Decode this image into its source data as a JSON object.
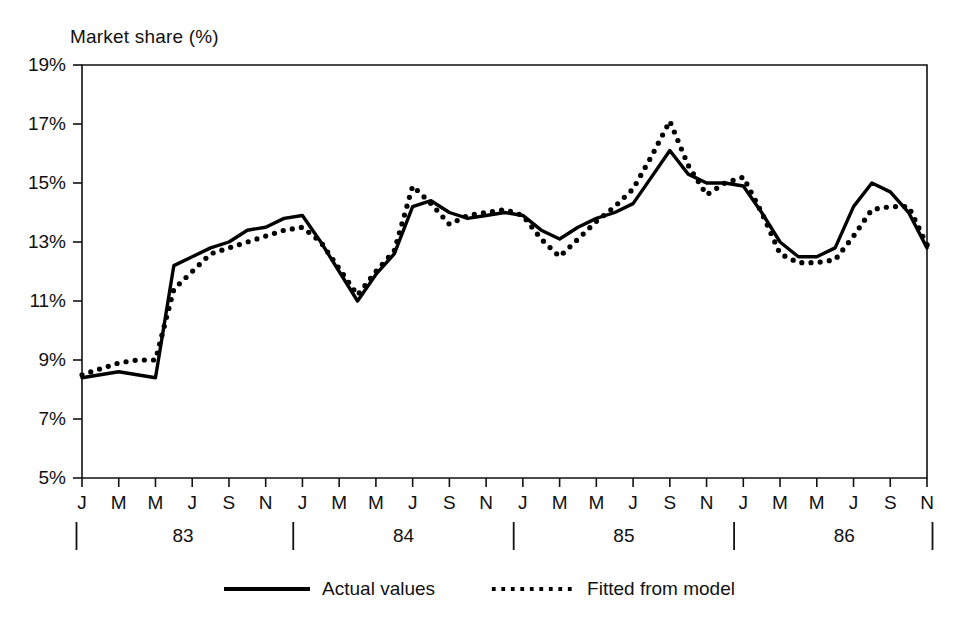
{
  "chart_data": {
    "type": "line",
    "title": "Market share (%)",
    "xlabel": "",
    "ylabel": "Market share (%)",
    "ylim": [
      5,
      19
    ],
    "yticks": [
      5,
      7,
      9,
      11,
      13,
      15,
      17,
      19
    ],
    "ytick_labels": [
      "5%",
      "7%",
      "9%",
      "11%",
      "13%",
      "15%",
      "17%",
      "19%"
    ],
    "grid": false,
    "legend_position": "bottom-center",
    "x": [
      "Jan 83",
      "Feb 83",
      "Mar 83",
      "Apr 83",
      "May 83",
      "Jun 83",
      "Jul 83",
      "Aug 83",
      "Sep 83",
      "Oct 83",
      "Nov 83",
      "Dec 83",
      "Jan 84",
      "Feb 84",
      "Mar 84",
      "Apr 84",
      "May 84",
      "Jun 84",
      "Jul 84",
      "Aug 84",
      "Sep 84",
      "Oct 84",
      "Nov 84",
      "Dec 84",
      "Jan 85",
      "Feb 85",
      "Mar 85",
      "Apr 85",
      "May 85",
      "Jun 85",
      "Jul 85",
      "Aug 85",
      "Sep 85",
      "Oct 85",
      "Nov 85",
      "Dec 85",
      "Jan 86",
      "Feb 86",
      "Mar 86",
      "Apr 86",
      "May 86",
      "Jun 86",
      "Jul 86",
      "Aug 86",
      "Sep 86",
      "Oct 86",
      "Nov 86"
    ],
    "xtick_labels": [
      "J",
      "M",
      "M",
      "J",
      "S",
      "N",
      "J",
      "M",
      "M",
      "J",
      "S",
      "N",
      "J",
      "M",
      "M",
      "J",
      "S",
      "N",
      "J",
      "M",
      "M",
      "J",
      "S",
      "N"
    ],
    "xtick_months": [
      0,
      2,
      4,
      6,
      8,
      10,
      12,
      14,
      16,
      18,
      20,
      22,
      24,
      26,
      28,
      30,
      32,
      34,
      36,
      38,
      40,
      42,
      44,
      46
    ],
    "year_labels": [
      "83",
      "84",
      "85",
      "86"
    ],
    "year_label_months": [
      5.5,
      17.5,
      29.5,
      41.5
    ],
    "year_divider_months": [
      -0.3,
      11.5,
      23.5,
      35.5,
      46.3
    ],
    "series": [
      {
        "name": "Actual values",
        "style": "solid",
        "color": "#000000",
        "values": [
          8.4,
          8.5,
          8.6,
          8.5,
          8.4,
          12.2,
          12.5,
          12.8,
          13.0,
          13.4,
          13.5,
          13.8,
          13.9,
          13.0,
          12.0,
          11.0,
          11.9,
          12.6,
          14.2,
          14.4,
          14.0,
          13.8,
          13.9,
          14.0,
          13.9,
          13.4,
          13.1,
          13.5,
          13.8,
          14.0,
          14.3,
          15.2,
          16.1,
          15.3,
          15.0,
          15.0,
          14.9,
          14.0,
          13.0,
          12.5,
          12.5,
          12.8,
          14.2,
          15.0,
          14.7,
          14.0,
          12.8
        ]
      },
      {
        "name": "Fitted from model",
        "style": "dotted",
        "color": "#000000",
        "values": [
          8.5,
          8.7,
          8.9,
          9.0,
          9.0,
          11.4,
          12.0,
          12.6,
          12.8,
          13.0,
          13.2,
          13.4,
          13.5,
          13.0,
          12.1,
          11.2,
          12.0,
          12.7,
          14.9,
          14.3,
          13.6,
          13.9,
          14.0,
          14.1,
          13.9,
          13.1,
          12.5,
          13.1,
          13.7,
          14.2,
          14.8,
          15.9,
          17.1,
          15.6,
          14.6,
          15.0,
          15.2,
          14.0,
          12.6,
          12.3,
          12.3,
          12.4,
          13.2,
          14.1,
          14.2,
          14.2,
          12.9
        ]
      }
    ]
  },
  "legend": {
    "entries": [
      {
        "label": "Actual values",
        "style": "solid"
      },
      {
        "label": "Fitted from model",
        "style": "dotted"
      }
    ]
  }
}
